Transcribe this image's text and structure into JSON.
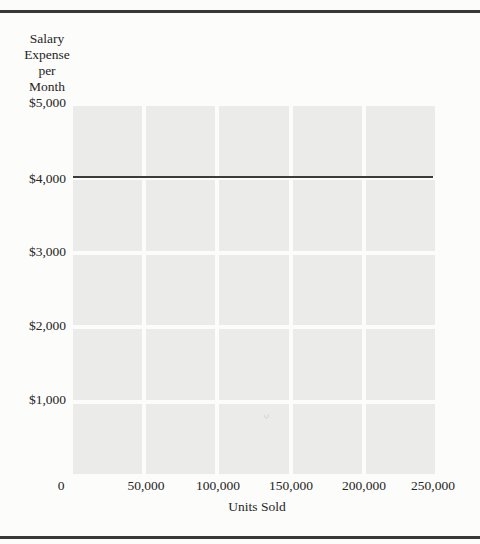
{
  "figure": {
    "y_axis_title_lines": [
      "Salary",
      "Expense",
      "per",
      "Month"
    ],
    "x_axis_title": "Units Sold",
    "y_tick_labels": [
      "$5,000",
      "$4,000",
      "$3,000",
      "$2,000",
      "$1,000"
    ],
    "origin_label": "0",
    "x_tick_labels": [
      "50,000",
      "100,000",
      "150,000",
      "200,000",
      "250,000"
    ]
  },
  "chart_data": {
    "type": "line",
    "title": "",
    "xlabel": "Units Sold",
    "ylabel": "Salary Expense per Month",
    "xlim": [
      0,
      250000
    ],
    "ylim": [
      0,
      5000
    ],
    "x_ticks": [
      0,
      50000,
      100000,
      150000,
      200000,
      250000
    ],
    "y_ticks": [
      0,
      1000,
      2000,
      3000,
      4000,
      5000
    ],
    "grid": "on",
    "legend": "none",
    "series": [
      {
        "name": "salary-expense-fixed-line",
        "x": [
          0,
          250000
        ],
        "y": [
          4000,
          4000
        ]
      }
    ]
  },
  "colors": {
    "page_background": "#fcfcfa",
    "grid_cell": "#ebebe9",
    "gridline_gap": "#fcfcfa",
    "data_line": "#3c3c3c",
    "page_rule": "#383838",
    "text": "#252525"
  }
}
